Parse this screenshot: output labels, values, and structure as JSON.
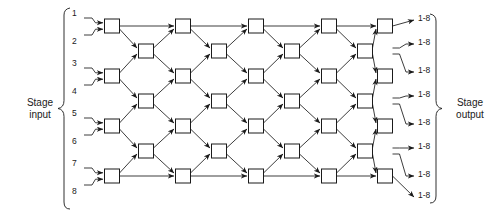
{
  "figure": {
    "type": "multistage-switching-network-diagram",
    "left_label": {
      "line1": "Stage",
      "line2": "input"
    },
    "right_label": {
      "line1": "Stage",
      "line2": "output"
    },
    "input_labels": [
      "1",
      "2",
      "3",
      "4",
      "5",
      "6",
      "7",
      "8"
    ],
    "output_labels": [
      "1-8",
      "1-8",
      "1-8",
      "1-8",
      "1-8",
      "1-8",
      "1-8",
      "1-8"
    ],
    "columns": 9,
    "rows": 7,
    "colors": {
      "line": "#1a1a1a",
      "node_fill": "#ffffff",
      "node_stroke": "#1a1a1a",
      "text": "#1a1a1a"
    },
    "geometry": {
      "col_x": [
        112,
        146,
        183,
        219,
        256,
        292,
        329,
        365,
        385
      ],
      "row_y": [
        26,
        51,
        76,
        101,
        126,
        151,
        176,
        193
      ],
      "node_w": 15,
      "node_h": 14,
      "odd_rows": [
        0,
        2,
        4,
        6
      ],
      "even_rows": [
        1,
        3,
        5
      ]
    },
    "input_pair_y": [
      18,
      35,
      68,
      85,
      118,
      135,
      168,
      185
    ],
    "output_y": [
      20,
      44,
      72,
      96,
      124,
      148,
      176,
      197
    ]
  }
}
